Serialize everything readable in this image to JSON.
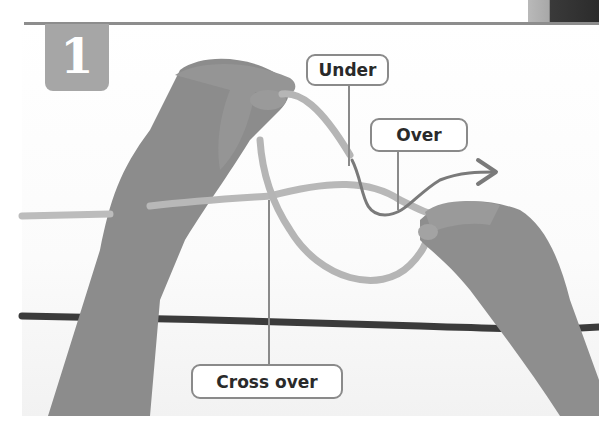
{
  "figure": {
    "step_number": "1",
    "labels": {
      "under": "Under",
      "over": "Over",
      "cross_over": "Cross over"
    },
    "icons": {
      "direction_arrow": "arrow-right-icon"
    },
    "colors": {
      "badge": "#a6a6a6",
      "rule": "#8d8d8d",
      "label_border": "#8a8a8a",
      "light_rope": "#b8b8b8",
      "dark_rope": "#3a3a3a",
      "skin": "#8f8f8f"
    }
  }
}
